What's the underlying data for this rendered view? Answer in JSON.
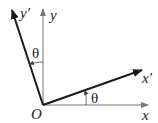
{
  "diagram": {
    "title": "",
    "type": "coordinate-rotation",
    "labels": {
      "origin": "O",
      "x_axis": "x",
      "y_axis": "y",
      "x_prime_axis": "x′",
      "y_prime_axis": "y′",
      "angle_top": "θ",
      "angle_bottom": "θ"
    },
    "colors": {
      "original_axes": "#777777",
      "rotated_axes": "#1a1a1a",
      "text": "#222222"
    }
  }
}
